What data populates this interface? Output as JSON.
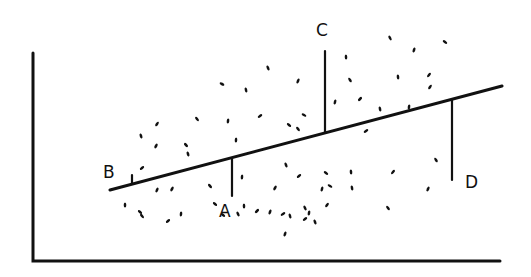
{
  "diagram": {
    "type": "scatter-with-regression-line",
    "style": "hand-drawn sketch",
    "ink_color": "#111111",
    "background": "#ffffff",
    "axes": {
      "y_axis": {
        "x": 33,
        "y1": 53,
        "y2": 261
      },
      "x_axis": {
        "y": 261,
        "x1": 33,
        "x2": 500
      }
    },
    "regression_line": {
      "x1": 110,
      "y1": 190,
      "x2": 502,
      "y2": 86
    },
    "residuals": [
      {
        "label": "A",
        "x": 232,
        "y_line": 158,
        "y_point": 196,
        "label_x": 219,
        "label_y": 203
      },
      {
        "label": "B",
        "x": 132,
        "y_line": 184,
        "y_point": 175,
        "label_x": 103,
        "label_y": 164
      },
      {
        "label": "C",
        "x": 325,
        "y_line": 133,
        "y_point": 51,
        "label_x": 316,
        "label_y": 22
      },
      {
        "label": "D",
        "x": 452,
        "y_line": 100,
        "y_point": 180,
        "label_x": 465,
        "label_y": 174
      }
    ],
    "points": [
      [
        222,
        84
      ],
      [
        246,
        90
      ],
      [
        157,
        124
      ],
      [
        197,
        119
      ],
      [
        228,
        121
      ],
      [
        260,
        116
      ],
      [
        141,
        136
      ],
      [
        156,
        146
      ],
      [
        186,
        145
      ],
      [
        236,
        140
      ],
      [
        142,
        168
      ],
      [
        268,
        68
      ],
      [
        298,
        81
      ],
      [
        289,
        125
      ],
      [
        346,
        57
      ],
      [
        360,
        99
      ],
      [
        390,
        38
      ],
      [
        414,
        50
      ],
      [
        445,
        42
      ],
      [
        398,
        77
      ],
      [
        429,
        75
      ],
      [
        350,
        80
      ],
      [
        335,
        102
      ],
      [
        304,
        115
      ],
      [
        380,
        109
      ],
      [
        430,
        87
      ],
      [
        298,
        129
      ],
      [
        409,
        107
      ],
      [
        366,
        131
      ],
      [
        188,
        154
      ],
      [
        172,
        189
      ],
      [
        210,
        186
      ],
      [
        242,
        177
      ],
      [
        299,
        176
      ],
      [
        286,
        165
      ],
      [
        157,
        190
      ],
      [
        215,
        204
      ],
      [
        244,
        206
      ],
      [
        257,
        211
      ],
      [
        305,
        208
      ],
      [
        285,
        234
      ],
      [
        326,
        173
      ],
      [
        351,
        172
      ],
      [
        393,
        172
      ],
      [
        436,
        160
      ],
      [
        322,
        189
      ],
      [
        330,
        186
      ],
      [
        352,
        188
      ],
      [
        327,
        205
      ],
      [
        388,
        208
      ],
      [
        309,
        213
      ],
      [
        283,
        214
      ],
      [
        290,
        216
      ],
      [
        275,
        188
      ],
      [
        142,
        216
      ],
      [
        181,
        214
      ],
      [
        305,
        219
      ],
      [
        315,
        222
      ],
      [
        428,
        189
      ],
      [
        140,
        212
      ],
      [
        125,
        205
      ],
      [
        168,
        221
      ],
      [
        238,
        214
      ],
      [
        270,
        212
      ],
      [
        223,
        215
      ]
    ]
  }
}
